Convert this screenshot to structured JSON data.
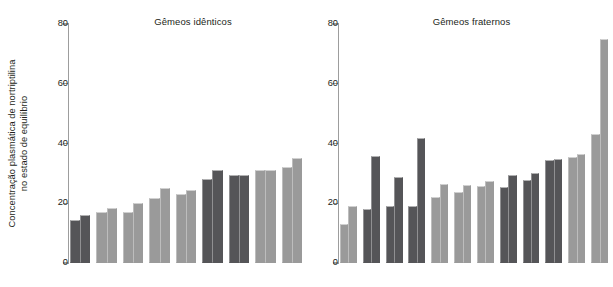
{
  "ylabel": {
    "line1": "Concentração plasmática de nortriptilina",
    "line2": "no estado de equilíbrio"
  },
  "colors": {
    "light_gray": "#9a9a9a",
    "dark_gray": "#555558",
    "axis": "#9d9d9d",
    "text": "#231f20"
  },
  "axis": {
    "ticks": [
      "0",
      "20",
      "40",
      "60",
      "80"
    ]
  },
  "panels": [
    {
      "id": "identical",
      "title": "Gêmeos idênticos"
    },
    {
      "id": "fraternal",
      "title": "Gêmeos fraternos"
    }
  ],
  "chart_data": [
    {
      "type": "bar",
      "title": "Gêmeos idênticos",
      "xlabel": "",
      "ylabel": "Concentração plasmática de nortriptilina no estado de equilíbrio",
      "ylim": [
        0,
        80
      ],
      "yticks": [
        0,
        20,
        40,
        60,
        80
      ],
      "grid": false,
      "legend": "none",
      "categories": [
        "1",
        "2",
        "3",
        "4",
        "5",
        "6",
        "7",
        "8",
        "9"
      ],
      "series": [
        {
          "name": "Twin A",
          "values": [
            14.5,
            17.0,
            17.0,
            21.8,
            23.2,
            28.0,
            29.5,
            31.0,
            32.3
          ]
        },
        {
          "name": "Twin B",
          "values": [
            16.0,
            18.5,
            20.2,
            25.2,
            24.3,
            31.0,
            29.6,
            31.0,
            35.0
          ]
        }
      ],
      "bar_colors": [
        "#555558",
        "#9a9a9a",
        "#9a9a9a",
        "#9a9a9a",
        "#9a9a9a",
        "#555558",
        "#555558",
        "#9a9a9a",
        "#9a9a9a"
      ]
    },
    {
      "type": "bar",
      "title": "Gêmeos fraternos",
      "xlabel": "",
      "ylabel": "Concentração plasmática de nortriptilina no estado de equilíbrio",
      "ylim": [
        0,
        80
      ],
      "yticks": [
        0,
        20,
        40,
        60,
        80
      ],
      "grid": false,
      "legend": "none",
      "categories": [
        "1",
        "2",
        "3",
        "4",
        "5",
        "6",
        "7",
        "8",
        "9",
        "10",
        "11"
      ],
      "series": [
        {
          "name": "Twin A",
          "values": [
            13.2,
            18.2,
            19.0,
            19.0,
            22.0,
            23.7,
            25.7,
            25.6,
            27.9,
            34.4,
            35.5,
            43.3
          ]
        },
        {
          "name": "Twin B",
          "values": [
            19.0,
            35.7,
            28.8,
            42.0,
            26.6,
            26.0,
            27.5,
            29.3,
            30.0,
            34.8,
            36.6,
            75.0
          ]
        }
      ],
      "bar_colors": [
        "#9a9a9a",
        "#555558",
        "#555558",
        "#555558",
        "#9a9a9a",
        "#9a9a9a",
        "#9a9a9a",
        "#555558",
        "#555558",
        "#555558",
        "#9a9a9a",
        "#9a9a9a"
      ]
    }
  ]
}
